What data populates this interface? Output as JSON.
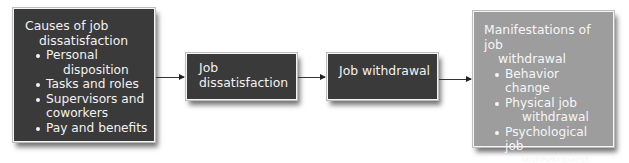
{
  "diagram": {
    "boxes": [
      {
        "title_line1": "Causes of job",
        "title_line2": "dissatisfaction",
        "items": [
          {
            "line1": "Personal",
            "line2": "disposition"
          },
          {
            "line1": "Tasks and roles"
          },
          {
            "line1": "Supervisors and",
            "line2": "coworkers"
          },
          {
            "line1": "Pay and benefits"
          }
        ],
        "fill": "#3a3a3a"
      },
      {
        "line1": "Job",
        "line2": "dissatisfaction",
        "fill": "#3a3a3a"
      },
      {
        "label": "Job withdrawal",
        "fill": "#3a3a3a"
      },
      {
        "title_line1": "Manifestations of job",
        "title_line2": "withdrawal",
        "items": [
          {
            "line1": "Behavior change"
          },
          {
            "line1": "Physical job",
            "line2": "withdrawal"
          },
          {
            "line1": "Psychological job",
            "line2": "withdrawal"
          }
        ],
        "fill": "#9d9d9d"
      }
    ],
    "arrows": [
      {
        "from": "Causes of job dissatisfaction",
        "to": "Job dissatisfaction"
      },
      {
        "from": "Job dissatisfaction",
        "to": "Job withdrawal"
      },
      {
        "from": "Job withdrawal",
        "to": "Manifestations of job withdrawal"
      }
    ]
  }
}
